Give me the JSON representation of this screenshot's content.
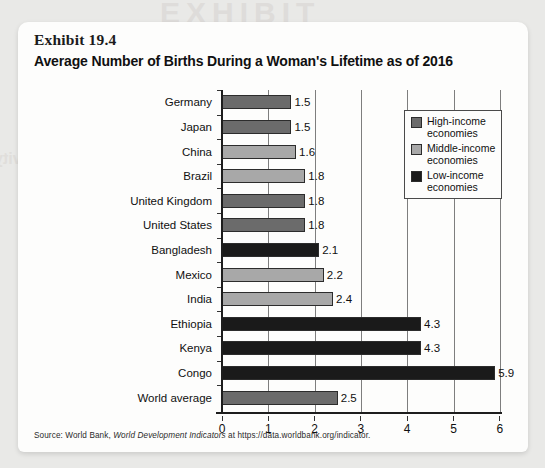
{
  "exhibit": {
    "number": "Exhibit 19.4",
    "title": "Average Number of Births During a Woman's Lifetime as of 2016"
  },
  "bleed_text": {
    "top": "EXHIBIT",
    "left": "Marginal Productivity"
  },
  "legend": {
    "items": [
      {
        "label": "High-income economies",
        "color": "#6b6b6b",
        "key": "high"
      },
      {
        "label": "Middle-income economies",
        "color": "#a8a8a8",
        "key": "middle"
      },
      {
        "label": "Low-income economies",
        "color": "#1a1a1a",
        "key": "low"
      }
    ]
  },
  "source": {
    "prefix": "Source: World Bank, ",
    "italic": "World Development Indicators",
    "suffix": " at https://data.worldbank.org/indicator."
  },
  "chart_data": {
    "type": "bar",
    "orientation": "horizontal",
    "title": "Average Number of Births During a Woman's Lifetime as of 2016",
    "xlabel": "",
    "ylabel": "",
    "xlim": [
      0,
      6
    ],
    "xticks": [
      0,
      1,
      2,
      3,
      4,
      5,
      6
    ],
    "xtick_labels": [
      "0",
      "1",
      "2",
      "3",
      "4",
      "5",
      "6"
    ],
    "grid": true,
    "legend_position": "upper-right-inside",
    "categories": [
      "Germany",
      "Japan",
      "China",
      "Brazil",
      "United Kingdom",
      "United States",
      "Bangladesh",
      "Mexico",
      "India",
      "Ethiopia",
      "Kenya",
      "Congo",
      "World average"
    ],
    "values": [
      1.5,
      1.5,
      1.6,
      1.8,
      1.8,
      1.8,
      2.1,
      2.2,
      2.4,
      4.3,
      4.3,
      5.9,
      2.5
    ],
    "value_labels": [
      "1.5",
      "1.5",
      "1.6",
      "1.8",
      "1.8",
      "1.8",
      "2.1",
      "2.2",
      "2.4",
      "4.3",
      "4.3",
      "5.9",
      "2.5"
    ],
    "groups": [
      "high",
      "high",
      "middle",
      "middle",
      "high",
      "high",
      "low",
      "middle",
      "middle",
      "low",
      "low",
      "low",
      "world"
    ],
    "group_colors": {
      "high": "#6b6b6b",
      "middle": "#a8a8a8",
      "low": "#1a1a1a",
      "world": "#6b6b6b"
    }
  }
}
